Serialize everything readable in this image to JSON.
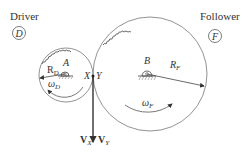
{
  "diagram": {
    "driver": {
      "title": "Driver",
      "symbol": "D",
      "center_label": "A",
      "radius_label": "R",
      "radius_sub": "D",
      "omega_label": "ω",
      "omega_sub": "D"
    },
    "follower": {
      "title": "Follower",
      "symbol": "F",
      "center_label": "B",
      "radius_label": "R",
      "radius_sub": "F",
      "omega_label": "ω",
      "omega_sub": "F"
    },
    "contact": {
      "point_x": "X",
      "point_y": "Y"
    },
    "velocity": {
      "vx_label": "V",
      "vx_sub": "X",
      "vy_label": "V",
      "vy_sub": "Y"
    },
    "colors": {
      "line": "#555555",
      "text": "#333333"
    }
  }
}
